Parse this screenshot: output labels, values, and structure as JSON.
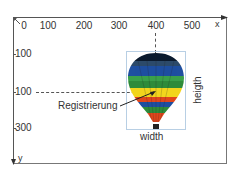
{
  "diagram": {
    "x_axis": {
      "label": "x",
      "ticks": [
        "0",
        "100",
        "200",
        "300",
        "400",
        "500"
      ]
    },
    "y_axis": {
      "label": "y",
      "ticks": [
        "100",
        "100",
        "300"
      ]
    },
    "annotations": {
      "registration": "Registrierung",
      "width": "width",
      "height": "heigth"
    },
    "object": {
      "name": "hot-air-balloon",
      "colors": [
        "#0b1a2e",
        "#1f4fa0",
        "#2e8b3a",
        "#f2d51c",
        "#e0461c",
        "#1f4fa0",
        "#e0461c"
      ]
    }
  }
}
